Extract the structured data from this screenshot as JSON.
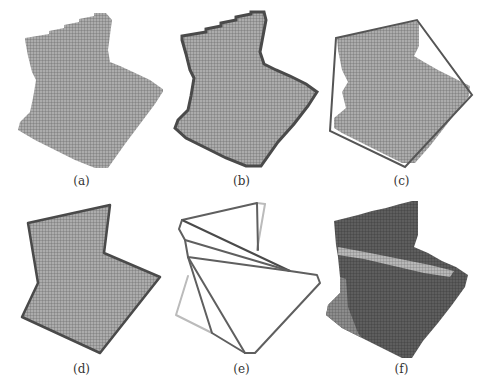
{
  "figure": {
    "panels": [
      {
        "id": "a",
        "label": "(a)",
        "description": "voxelized polygon"
      },
      {
        "id": "b",
        "label": "(b)",
        "description": "voxelized polygon with boundary voxels highlighted"
      },
      {
        "id": "c",
        "label": "(c)",
        "description": "voxelized polygon with convex hull"
      },
      {
        "id": "d",
        "label": "(d)",
        "description": "voxelized polygon with polygon outline"
      },
      {
        "id": "e",
        "label": "(e)",
        "description": "convex decomposition lines"
      },
      {
        "id": "f",
        "label": "(f)",
        "description": "voxelized polygon shaded by decomposition parts"
      }
    ]
  },
  "colors": {
    "background": "#ffffff",
    "fill": "#a8a8a8",
    "grid": "#6f6f6f",
    "boundary": "#4a4a4a",
    "hull": "#5a5a5a",
    "dark_fill": "#5c5c5c",
    "mid_fill": "#8a8a8a",
    "light_band": "#b5b5b5",
    "light_line": "#bdbdbd"
  }
}
